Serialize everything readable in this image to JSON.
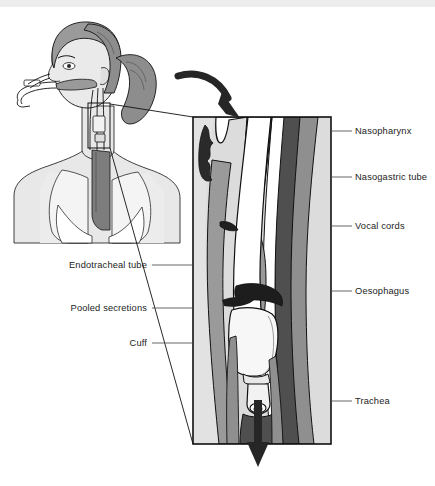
{
  "figure": {
    "background_color": "#ffffff",
    "top_band_color": "#ededed"
  },
  "palette": {
    "skin_light": "#e8e8e8",
    "skin_mid": "#d8d8d8",
    "tissue_light": "#d2d2d2",
    "tissue_mid": "#9a9a9a",
    "tissue_dark": "#4f4f4f",
    "secretions_dark": "#262626",
    "tube_white": "#ffffff",
    "hair_dark": "#8d8d8d",
    "outline": "#111111",
    "leader": "#4c4c4c",
    "text": "#232323"
  },
  "patient_figure": {
    "name": "patient-head-and-torso",
    "description": "Female patient head and upper torso, side-front view, with endotracheal tube and nasogastric tube entering nose and mouth, lungs and trachea visible",
    "detail_box": {
      "x": 88,
      "y": 103,
      "width": 22,
      "height": 45
    }
  },
  "detail_panel": {
    "name": "anatomical-cross-section-panel",
    "x": 193,
    "y": 117,
    "width": 138,
    "height": 327,
    "border_color": "#111111"
  },
  "arrows": [
    {
      "name": "inspiratory-flow-arrow-top",
      "direction": "curved-down-right",
      "color": "#262626"
    },
    {
      "name": "airflow-arrow-bottom",
      "direction": "down",
      "color": "#262626"
    }
  ],
  "labels_left": [
    {
      "id": "endotracheal-tube",
      "text": "Endotracheal tube",
      "text_x": 147,
      "text_y": 268,
      "leader": [
        [
          152,
          265
        ],
        [
          193,
          265
        ]
      ]
    },
    {
      "id": "pooled-secretions",
      "text": "Pooled secretions",
      "text_x": 147,
      "text_y": 311,
      "leader": [
        [
          152,
          308
        ],
        [
          193,
          308
        ]
      ]
    },
    {
      "id": "cuff",
      "text": "Cuff",
      "text_x": 147,
      "text_y": 346,
      "leader": [
        [
          152,
          343
        ],
        [
          193,
          343
        ]
      ]
    }
  ],
  "labels_right": [
    {
      "id": "nasopharynx",
      "text": "Nasopharynx",
      "text_x": 355,
      "text_y": 134,
      "leader": [
        [
          331,
          131
        ],
        [
          352,
          131
        ]
      ]
    },
    {
      "id": "nasogastric-tube",
      "text": "Nasogastric tube",
      "text_x": 355,
      "text_y": 180,
      "leader": [
        [
          331,
          177
        ],
        [
          352,
          177
        ]
      ]
    },
    {
      "id": "vocal-cords",
      "text": "Vocal cords",
      "text_x": 355,
      "text_y": 229,
      "leader": [
        [
          331,
          226
        ],
        [
          352,
          226
        ]
      ]
    },
    {
      "id": "oesophagus",
      "text": "Oesophagus",
      "text_x": 355,
      "text_y": 294,
      "leader": [
        [
          331,
          291
        ],
        [
          352,
          291
        ]
      ]
    },
    {
      "id": "trachea",
      "text": "Trachea",
      "text_x": 355,
      "text_y": 404,
      "leader": [
        [
          331,
          401
        ],
        [
          352,
          401
        ]
      ]
    }
  ],
  "anatomy_structures": [
    {
      "id": "nasopharynx",
      "label": "Nasopharynx"
    },
    {
      "id": "nasogastric-tube",
      "label": "Nasogastric tube"
    },
    {
      "id": "vocal-cords",
      "label": "Vocal cords"
    },
    {
      "id": "oesophagus",
      "label": "Oesophagus"
    },
    {
      "id": "trachea",
      "label": "Trachea"
    },
    {
      "id": "endotracheal-tube",
      "label": "Endotracheal tube"
    },
    {
      "id": "pooled-secretions",
      "label": "Pooled secretions"
    },
    {
      "id": "cuff",
      "label": "Cuff"
    }
  ]
}
